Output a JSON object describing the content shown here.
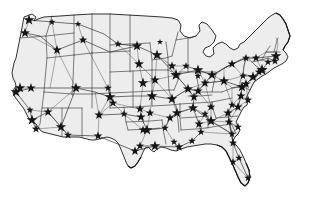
{
  "figure": {
    "kind": "map",
    "region": "Continental United States",
    "background_color": "#ffffff",
    "land_fill_color": "#ededed",
    "border_color": "#2b2b2b",
    "coast_color": "#111111",
    "network_color": "#3a3a3a",
    "hub_marker_color": "#151515",
    "hub_marker_shape": "five-pointed-star",
    "hub_count": 96,
    "legend_present": false,
    "labels_present": false,
    "axis_present": false
  },
  "chart_data": {
    "type": "map",
    "xlabel": "",
    "ylabel": "",
    "projection_hint": "albers-usa-like",
    "viewbox": [
      0,
      0,
      315,
      217
    ],
    "hubs": [
      {
        "name": "Seattle",
        "x": 29,
        "y": 20,
        "size": 5.6
      },
      {
        "name": "Spokane",
        "x": 52,
        "y": 22,
        "size": 3.6
      },
      {
        "name": "Portland",
        "x": 25,
        "y": 33,
        "size": 5.2
      },
      {
        "name": "Boise",
        "x": 57,
        "y": 50,
        "size": 5.0
      },
      {
        "name": "Billings",
        "x": 83,
        "y": 40,
        "size": 4.4
      },
      {
        "name": "Great Falls",
        "x": 78,
        "y": 24,
        "size": 3.4
      },
      {
        "name": "Fargo",
        "x": 137,
        "y": 46,
        "size": 5.4
      },
      {
        "name": "Bismarck",
        "x": 118,
        "y": 44,
        "size": 4.0
      },
      {
        "name": "Sioux Falls",
        "x": 139,
        "y": 64,
        "size": 5.2
      },
      {
        "name": "Minneapolis",
        "x": 157,
        "y": 55,
        "size": 5.6
      },
      {
        "name": "Duluth",
        "x": 160,
        "y": 42,
        "size": 3.2
      },
      {
        "name": "Sacramento",
        "x": 20,
        "y": 88,
        "size": 5.4
      },
      {
        "name": "San Francisco",
        "x": 16,
        "y": 92,
        "size": 5.6
      },
      {
        "name": "Reno",
        "x": 31,
        "y": 88,
        "size": 5.0
      },
      {
        "name": "Salt Lake City",
        "x": 76,
        "y": 88,
        "size": 5.4
      },
      {
        "name": "Denver",
        "x": 110,
        "y": 97,
        "size": 5.6
      },
      {
        "name": "Colorado Springs",
        "x": 113,
        "y": 103,
        "size": 4.4
      },
      {
        "name": "Cheyenne",
        "x": 108,
        "y": 88,
        "size": 4.0
      },
      {
        "name": "Omaha",
        "x": 143,
        "y": 83,
        "size": 5.4
      },
      {
        "name": "Des Moines",
        "x": 155,
        "y": 80,
        "size": 5.0
      },
      {
        "name": "Kansas City",
        "x": 152,
        "y": 96,
        "size": 5.6
      },
      {
        "name": "Wichita",
        "x": 140,
        "y": 109,
        "size": 4.6
      },
      {
        "name": "St. Louis",
        "x": 172,
        "y": 99,
        "size": 5.4
      },
      {
        "name": "Chicago",
        "x": 176,
        "y": 75,
        "size": 6.0
      },
      {
        "name": "Milwaukee",
        "x": 172,
        "y": 66,
        "size": 4.6
      },
      {
        "name": "Indianapolis",
        "x": 188,
        "y": 89,
        "size": 5.2
      },
      {
        "name": "Detroit",
        "x": 198,
        "y": 70,
        "size": 5.6
      },
      {
        "name": "Grand Rapids",
        "x": 186,
        "y": 66,
        "size": 4.0
      },
      {
        "name": "Cleveland",
        "x": 212,
        "y": 75,
        "size": 5.2
      },
      {
        "name": "Columbus",
        "x": 205,
        "y": 83,
        "size": 4.8
      },
      {
        "name": "Cincinnati",
        "x": 198,
        "y": 91,
        "size": 4.8
      },
      {
        "name": "Toledo",
        "x": 198,
        "y": 76,
        "size": 3.6
      },
      {
        "name": "Pittsburgh",
        "x": 224,
        "y": 81,
        "size": 5.2
      },
      {
        "name": "Buffalo",
        "x": 232,
        "y": 64,
        "size": 4.6
      },
      {
        "name": "Syracuse",
        "x": 246,
        "y": 58,
        "size": 4.2
      },
      {
        "name": "Albany",
        "x": 256,
        "y": 58,
        "size": 4.4
      },
      {
        "name": "Boston",
        "x": 276,
        "y": 56,
        "size": 5.6
      },
      {
        "name": "Providence",
        "x": 275,
        "y": 61,
        "size": 4.2
      },
      {
        "name": "Hartford",
        "x": 268,
        "y": 62,
        "size": 4.0
      },
      {
        "name": "New York",
        "x": 262,
        "y": 70,
        "size": 6.0
      },
      {
        "name": "Newark",
        "x": 259,
        "y": 72,
        "size": 4.4
      },
      {
        "name": "Philadelphia",
        "x": 253,
        "y": 77,
        "size": 5.6
      },
      {
        "name": "Harrisburg",
        "x": 243,
        "y": 76,
        "size": 4.0
      },
      {
        "name": "Baltimore",
        "x": 246,
        "y": 84,
        "size": 5.0
      },
      {
        "name": "Washington DC",
        "x": 242,
        "y": 87,
        "size": 5.4
      },
      {
        "name": "Richmond",
        "x": 241,
        "y": 96,
        "size": 4.8
      },
      {
        "name": "Norfolk",
        "x": 248,
        "y": 100,
        "size": 4.4
      },
      {
        "name": "Raleigh",
        "x": 238,
        "y": 107,
        "size": 4.8
      },
      {
        "name": "Charlotte",
        "x": 228,
        "y": 113,
        "size": 5.0
      },
      {
        "name": "Greensboro",
        "x": 232,
        "y": 105,
        "size": 4.0
      },
      {
        "name": "Columbia",
        "x": 229,
        "y": 122,
        "size": 4.4
      },
      {
        "name": "Charleston SC",
        "x": 238,
        "y": 127,
        "size": 4.2
      },
      {
        "name": "Savannah",
        "x": 232,
        "y": 134,
        "size": 4.0
      },
      {
        "name": "Atlanta",
        "x": 211,
        "y": 121,
        "size": 5.6
      },
      {
        "name": "Knoxville",
        "x": 211,
        "y": 107,
        "size": 4.4
      },
      {
        "name": "Nashville",
        "x": 193,
        "y": 108,
        "size": 5.2
      },
      {
        "name": "Chattanooga",
        "x": 205,
        "y": 114,
        "size": 4.0
      },
      {
        "name": "Memphis",
        "x": 177,
        "y": 113,
        "size": 5.2
      },
      {
        "name": "Louisville",
        "x": 194,
        "y": 97,
        "size": 4.8
      },
      {
        "name": "Birmingham",
        "x": 199,
        "y": 124,
        "size": 4.8
      },
      {
        "name": "Montgomery",
        "x": 201,
        "y": 132,
        "size": 4.0
      },
      {
        "name": "Mobile",
        "x": 192,
        "y": 141,
        "size": 4.0
      },
      {
        "name": "Jacksonville",
        "x": 233,
        "y": 143,
        "size": 4.4
      },
      {
        "name": "Orlando",
        "x": 239,
        "y": 158,
        "size": 4.0
      },
      {
        "name": "Tampa",
        "x": 233,
        "y": 162,
        "size": 4.0
      },
      {
        "name": "Miami",
        "x": 248,
        "y": 178,
        "size": 4.0
      },
      {
        "name": "New Orleans",
        "x": 179,
        "y": 147,
        "size": 4.6
      },
      {
        "name": "Baton Rouge",
        "x": 174,
        "y": 142,
        "size": 3.8
      },
      {
        "name": "Shreveport",
        "x": 165,
        "y": 128,
        "size": 4.0
      },
      {
        "name": "Little Rock",
        "x": 170,
        "y": 118,
        "size": 4.6
      },
      {
        "name": "Oklahoma City",
        "x": 141,
        "y": 117,
        "size": 5.0
      },
      {
        "name": "Tulsa",
        "x": 150,
        "y": 113,
        "size": 4.4
      },
      {
        "name": "Dallas",
        "x": 147,
        "y": 130,
        "size": 5.6
      },
      {
        "name": "Fort Worth",
        "x": 143,
        "y": 130,
        "size": 4.6
      },
      {
        "name": "Austin",
        "x": 140,
        "y": 146,
        "size": 4.4
      },
      {
        "name": "San Antonio",
        "x": 135,
        "y": 151,
        "size": 4.8
      },
      {
        "name": "Houston",
        "x": 155,
        "y": 146,
        "size": 5.4
      },
      {
        "name": "El Paso",
        "x": 98,
        "y": 136,
        "size": 4.6
      },
      {
        "name": "Albuquerque",
        "x": 99,
        "y": 115,
        "size": 5.0
      },
      {
        "name": "Amarillo",
        "x": 124,
        "y": 114,
        "size": 4.0
      },
      {
        "name": "Phoenix",
        "x": 61,
        "y": 127,
        "size": 5.4
      },
      {
        "name": "Tucson",
        "x": 68,
        "y": 135,
        "size": 4.2
      },
      {
        "name": "Las Vegas",
        "x": 48,
        "y": 112,
        "size": 4.8
      },
      {
        "name": "Los Angeles",
        "x": 32,
        "y": 120,
        "size": 5.6
      },
      {
        "name": "San Diego",
        "x": 36,
        "y": 129,
        "size": 4.4
      },
      {
        "name": "Bakersfield",
        "x": 30,
        "y": 110,
        "size": 3.8
      }
    ]
  }
}
